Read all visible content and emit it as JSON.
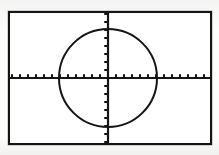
{
  "screen": {
    "device": "graphing-calculator",
    "width_px": 219,
    "height_px": 155,
    "frame": {
      "left_px": 8,
      "top_px": 11,
      "width_px": 204,
      "height_px": 134,
      "border_color": "#141414",
      "background_color": "#ffffff"
    }
  },
  "chart_data": {
    "type": "scatter",
    "title": "",
    "xlabel": "",
    "ylabel": "",
    "grid": false,
    "legend_position": "none",
    "axis_style": "crosshair-with-tick-marks",
    "tick_spacing_px": 8,
    "tick_spacing_units": 1,
    "origin_px": {
      "x": 108,
      "y": 78
    },
    "xlim": [
      -12.5,
      13
    ],
    "ylim": [
      -8.4,
      8.4
    ],
    "xticks": [
      -12,
      -11,
      -10,
      -9,
      -8,
      -7,
      -6,
      -5,
      -4,
      -3,
      -2,
      -1,
      1,
      2,
      3,
      4,
      5,
      6,
      7,
      8,
      9,
      10,
      11,
      12
    ],
    "yticks": [
      -8,
      -7,
      -6,
      -5,
      -4,
      -3,
      -2,
      -1,
      1,
      2,
      3,
      4,
      5,
      6,
      7,
      8
    ],
    "xtick_labels": [],
    "ytick_labels": [],
    "series": [
      {
        "name": "circle",
        "equation": "x^2 + y^2 = 36",
        "shape": "circle",
        "center": [
          0,
          0
        ],
        "radius": 6,
        "radius_px": 49,
        "color": "#141414",
        "line_width_px": 2,
        "rendering": "pixelated-plot"
      }
    ],
    "annotations": []
  }
}
